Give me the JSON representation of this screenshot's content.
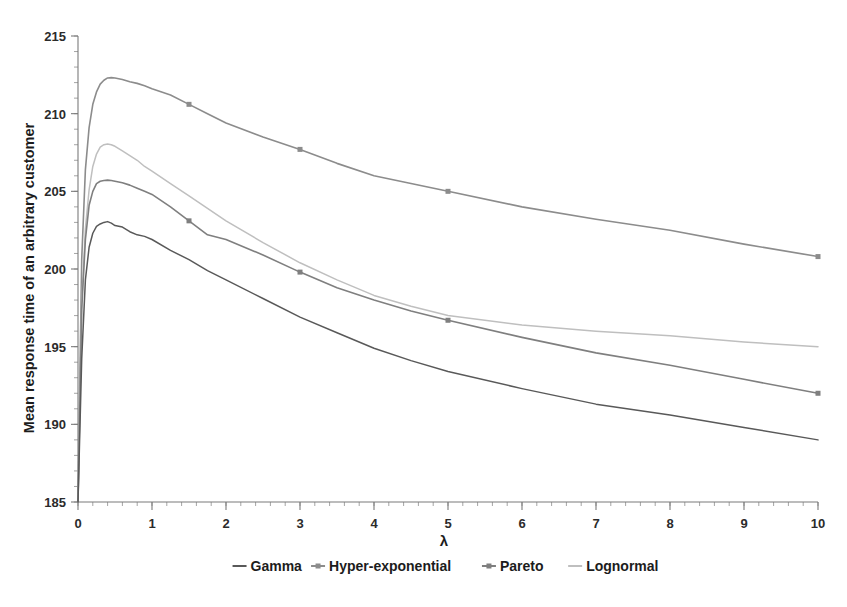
{
  "chart_data": {
    "type": "line",
    "title": "",
    "xlabel": "λ",
    "ylabel": "Mean response time of an arbitrary customer",
    "xlim": [
      0,
      10
    ],
    "ylim": [
      185,
      215
    ],
    "xticks": [
      "0",
      "1",
      "2",
      "3",
      "4",
      "5",
      "6",
      "7",
      "8",
      "9",
      "10"
    ],
    "yticks": [
      "185",
      "190",
      "195",
      "200",
      "205",
      "210",
      "215"
    ],
    "x_minor_tick_step": 0.2,
    "y_minor_tick_step": 1,
    "grid": false,
    "legend_position": "bottom",
    "x": [
      0,
      0.05,
      0.1,
      0.15,
      0.2,
      0.25,
      0.3,
      0.35,
      0.4,
      0.45,
      0.5,
      0.6,
      0.7,
      0.8,
      0.9,
      1.0,
      1.25,
      1.5,
      1.75,
      2.0,
      2.5,
      3.0,
      3.5,
      4.0,
      4.5,
      5.0,
      6.0,
      7.0,
      8.0,
      9.0,
      10.0
    ],
    "series": [
      {
        "name": "Hyper-exponential",
        "color": "#8c8c8c",
        "marker": "square",
        "values": [
          185.0,
          200.6,
          206.4,
          209.1,
          210.6,
          211.4,
          211.9,
          212.15,
          212.3,
          212.32,
          212.3,
          212.2,
          212.05,
          211.95,
          211.8,
          211.6,
          211.2,
          210.6,
          210.0,
          209.4,
          208.5,
          207.7,
          206.8,
          206.0,
          205.5,
          205.0,
          204.0,
          203.2,
          202.5,
          201.6,
          200.8
        ]
      },
      {
        "name": "Lognormal",
        "color": "#bfbfbf",
        "marker": "none",
        "values": [
          185.0,
          197.8,
          202.6,
          205.1,
          206.6,
          207.4,
          207.85,
          208.0,
          208.05,
          208.0,
          207.9,
          207.6,
          207.3,
          207.0,
          206.6,
          206.3,
          205.5,
          204.7,
          203.9,
          203.1,
          201.7,
          200.4,
          199.3,
          198.3,
          197.6,
          197.0,
          196.4,
          196.0,
          195.7,
          195.3,
          195.0
        ]
      },
      {
        "name": "Pareto",
        "color": "#7f7f7f",
        "marker": "square",
        "values": [
          185.0,
          197.4,
          201.9,
          204.1,
          205.0,
          205.5,
          205.65,
          205.7,
          205.72,
          205.7,
          205.65,
          205.55,
          205.4,
          205.2,
          205.0,
          204.8,
          204.0,
          203.1,
          202.2,
          201.9,
          200.9,
          199.8,
          198.8,
          198.0,
          197.3,
          196.7,
          195.6,
          194.6,
          193.8,
          192.9,
          192.0
        ]
      },
      {
        "name": "Gamma",
        "color": "#595959",
        "marker": "none",
        "values": [
          185.0,
          194.2,
          199.3,
          201.4,
          202.3,
          202.75,
          202.9,
          203.0,
          203.05,
          202.95,
          202.8,
          202.7,
          202.4,
          202.2,
          202.1,
          201.9,
          201.2,
          200.6,
          199.9,
          199.3,
          198.1,
          196.9,
          195.9,
          194.9,
          194.1,
          193.4,
          192.3,
          191.3,
          190.6,
          189.8,
          189.0
        ]
      }
    ],
    "marker_x": [
      1.5,
      3.0,
      5.0,
      10.0
    ]
  },
  "legend": {
    "items": [
      {
        "label": "Gamma",
        "color": "#595959",
        "marker": "none"
      },
      {
        "label": "Hyper-exponential",
        "color": "#8c8c8c",
        "marker": "square"
      },
      {
        "label": "Pareto",
        "color": "#7f7f7f",
        "marker": "square"
      },
      {
        "label": "Lognormal",
        "color": "#bfbfbf",
        "marker": "none"
      }
    ]
  },
  "axes": {
    "y_title": "Mean response time of an arbitrary customer",
    "x_title": "λ"
  }
}
